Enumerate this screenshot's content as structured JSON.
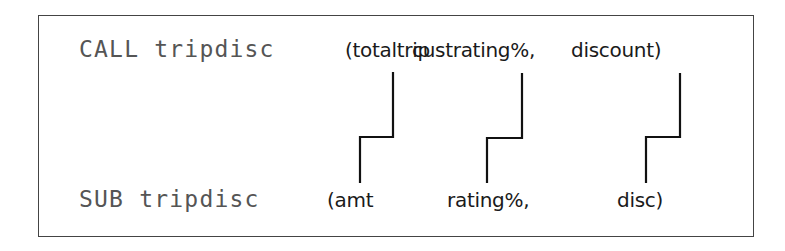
{
  "call_line": {
    "keyword_and_name": "CALL tripdisc",
    "args": [
      {
        "label": "(totaltrip"
      },
      {
        "label": "custrating%,"
      },
      {
        "label": "discount)"
      }
    ]
  },
  "sub_line": {
    "keyword_and_name": "SUB tripdisc",
    "params": [
      {
        "label": "(amt"
      },
      {
        "label": "rating%,"
      },
      {
        "label": "disc)"
      }
    ]
  },
  "connectors": [
    {
      "from": "totaltrip",
      "to": "amt"
    },
    {
      "from": "custrating%",
      "to": "rating%"
    },
    {
      "from": "discount",
      "to": "disc"
    }
  ],
  "colors": {
    "frame": "#444444",
    "code_text": "#555555",
    "arg_text": "#1a1a1a",
    "connector": "#111111"
  }
}
